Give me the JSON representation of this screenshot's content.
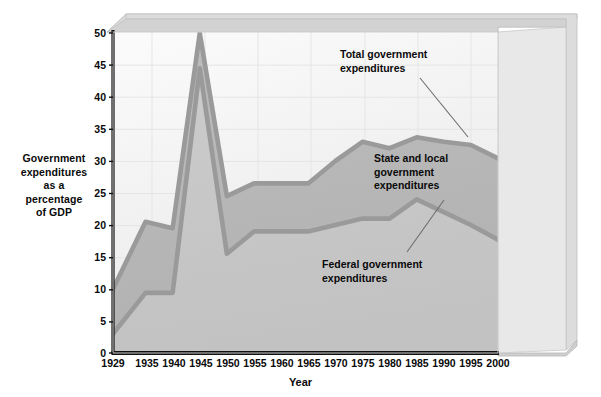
{
  "chart_data": {
    "type": "area",
    "title": "",
    "xlabel": "Year",
    "ylabel": "Government expenditures as a percentage of GDP",
    "ylim": [
      0,
      50
    ],
    "ytick_step": 5,
    "grid": true,
    "legend_position": "inline-annotations",
    "categories": [
      "1929",
      "1935",
      "1940",
      "1945",
      "1950",
      "1955",
      "1960",
      "1965",
      "1970",
      "1975",
      "1980",
      "1985",
      "1990",
      "1995",
      "2000"
    ],
    "x": [
      1929,
      1935,
      1940,
      1945,
      1950,
      1955,
      1960,
      1965,
      1970,
      1975,
      1980,
      1985,
      1990,
      1995,
      2000
    ],
    "yticks": [
      0,
      5,
      10,
      15,
      20,
      25,
      30,
      35,
      40,
      45,
      50
    ],
    "series": [
      {
        "name": "Total government expenditures",
        "values": [
          10.0,
          20.5,
          19.5,
          50.0,
          24.5,
          26.5,
          26.5,
          26.5,
          30.0,
          33.0,
          32.0,
          33.7,
          33.0,
          32.5,
          30.4
        ]
      },
      {
        "name": "Federal government expenditures",
        "values": [
          3.0,
          9.4,
          9.4,
          44.5,
          15.5,
          19.0,
          19.0,
          19.0,
          20.0,
          21.0,
          21.0,
          24.0,
          22.0,
          20.0,
          17.7
        ]
      }
    ],
    "annotations": [
      {
        "id": "total",
        "text": "Total government\nexpenditures"
      },
      {
        "id": "state_local",
        "text": "State and local\ngovernment\nexpenditures"
      },
      {
        "id": "federal",
        "text": "Federal government\nexpenditures"
      }
    ]
  },
  "axis": {
    "y_title_line1": "Government",
    "y_title_line2": "expenditures",
    "y_title_line3": "as a",
    "y_title_line4": "percentage",
    "y_title_line5": "of GDP",
    "x_title": "Year"
  },
  "ylabels": {
    "t0": "0",
    "t5": "5",
    "t10": "10",
    "t15": "15",
    "t20": "20",
    "t25": "25",
    "t30": "30",
    "t35": "35",
    "t40": "40",
    "t45": "45",
    "t50": "50"
  },
  "xlabels": {
    "x0": "1929",
    "x1": "1935",
    "x2": "1940",
    "x3": "1945",
    "x4": "1950",
    "x5": "1955",
    "x6": "1960",
    "x7": "1965",
    "x8": "1970",
    "x9": "1975",
    "x10": "1980",
    "x11": "1985",
    "x12": "1990",
    "x13": "1995",
    "x14": "2000"
  },
  "annotations": {
    "total": "Total government\nexpenditures",
    "state_local": "State and local\ngovernment\nexpenditures",
    "federal": "Federal government\nexpenditures"
  },
  "colors": {
    "line": "#9a9a9a",
    "band_upper_fill": "#b9b9b9",
    "band_lower_fill": "#c9c9c9",
    "plot_bg": "#f2f2f2",
    "frame_top": "#d5d5d5",
    "frame_side": "#c4c4c4",
    "grid": "#e4e4e4",
    "axis": "#101010",
    "text": "#0a0a0a"
  }
}
